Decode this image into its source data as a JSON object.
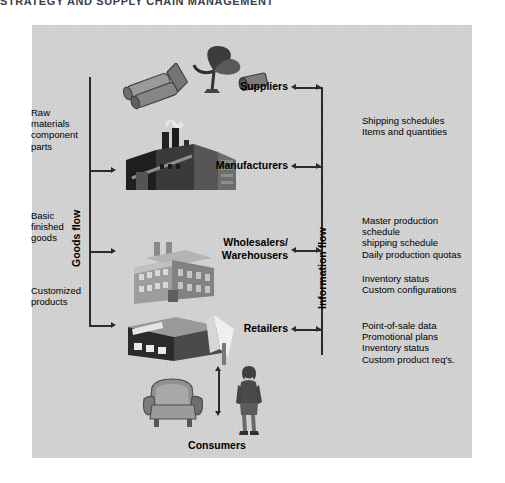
{
  "header": {
    "title": "STRATEGY AND SUPPLY CHAIN MANAGEMENT"
  },
  "diagram": {
    "goods_flow_label": "Goods flow",
    "information_flow_label": "Information flow",
    "stages": [
      {
        "key": "suppliers",
        "label": "Suppliers"
      },
      {
        "key": "manufacturers",
        "label": "Manufacturers"
      },
      {
        "key": "wholesalers",
        "label": "Wholesalers/\nWarehousers"
      },
      {
        "key": "retailers",
        "label": "Retailers"
      },
      {
        "key": "consumers",
        "label": "Consumers"
      }
    ],
    "goods_inputs": [
      {
        "key": "raw-materials",
        "text": "Raw\nmaterials\ncomponent\nparts"
      },
      {
        "key": "basic-finished-goods",
        "text": "Basic\nfinished\ngoods"
      },
      {
        "key": "customized-products",
        "text": "Customized\nproducts"
      }
    ],
    "information_items": [
      {
        "key": "supplier-info",
        "text": "Shipping schedules\nItems and quantities"
      },
      {
        "key": "manufacturer-info",
        "text": "Master production\nschedule\nshipping  schedule\nDaily production quotas"
      },
      {
        "key": "wholesaler-info",
        "text": "Inventory status\nCustom configurations"
      },
      {
        "key": "retailer-info",
        "text": "Point-of-sale data\nPromotional plans\nInventory status\nCustom product req's."
      }
    ],
    "artwork": [
      {
        "key": "steel-rolls-icon"
      },
      {
        "key": "satellite-dish-icon"
      },
      {
        "key": "log-icon"
      },
      {
        "key": "factory-icon"
      },
      {
        "key": "warehouse-icon"
      },
      {
        "key": "retail-store-icon"
      },
      {
        "key": "armchair-icon"
      },
      {
        "key": "consumer-person-icon"
      }
    ]
  },
  "colors": {
    "panel": "#d2d2d2",
    "ink": "#2b2b2b",
    "text": "#000000",
    "title": "#3a3f4a"
  }
}
